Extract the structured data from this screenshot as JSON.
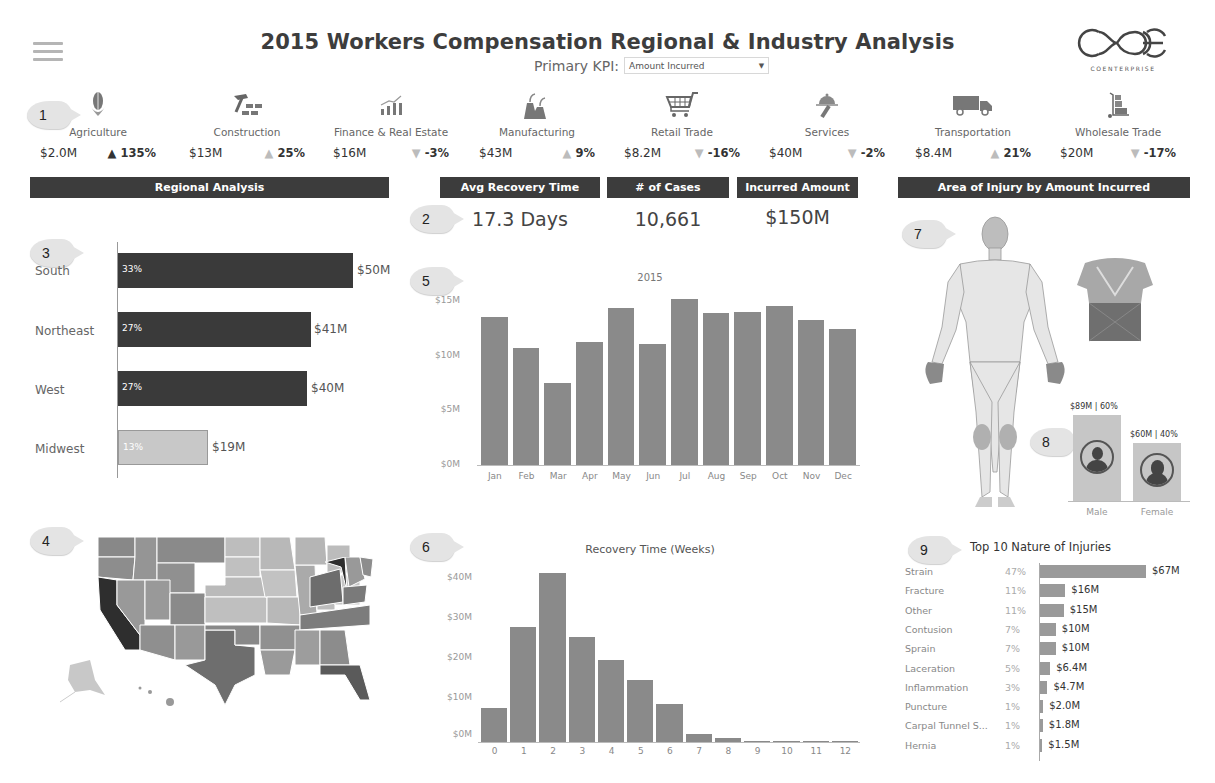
{
  "header": {
    "title": "2015 Workers Compensation Regional & Industry Analysis",
    "kpi_label": "Primary KPI:",
    "kpi_value": "Amount Incurred",
    "logo_text": "COENTERPRISE"
  },
  "markers": [
    "1",
    "2",
    "3",
    "4",
    "5",
    "6",
    "7",
    "8",
    "9"
  ],
  "industries": [
    {
      "name": "Agriculture",
      "value": "$2.0M",
      "delta": "135%",
      "direction": "up",
      "emphasis": "dark",
      "icon": "corn-icon"
    },
    {
      "name": "Construction",
      "value": "$13M",
      "delta": "25%",
      "direction": "up",
      "emphasis": "light",
      "icon": "hammer-bricks-icon"
    },
    {
      "name": "Finance & Real Estate",
      "value": "$16M",
      "delta": "-3%",
      "direction": "down",
      "emphasis": "light",
      "icon": "growth-chart-icon"
    },
    {
      "name": "Manufacturing",
      "value": "$43M",
      "delta": "9%",
      "direction": "up",
      "emphasis": "light",
      "icon": "factory-icon"
    },
    {
      "name": "Retail Trade",
      "value": "$8.2M",
      "delta": "-16%",
      "direction": "down",
      "emphasis": "light",
      "icon": "shopping-cart-icon"
    },
    {
      "name": "Services",
      "value": "$40M",
      "delta": "-2%",
      "direction": "down",
      "emphasis": "light",
      "icon": "service-cloche-icon"
    },
    {
      "name": "Transportation",
      "value": "$8.4M",
      "delta": "21%",
      "direction": "up",
      "emphasis": "light",
      "icon": "truck-icon"
    },
    {
      "name": "Wholesale Trade",
      "value": "$20M",
      "delta": "-17%",
      "direction": "down",
      "emphasis": "light",
      "icon": "hand-truck-icon"
    }
  ],
  "sections": {
    "regional": "Regional Analysis",
    "avg_recovery": "Avg Recovery Time",
    "cases": "# of Cases",
    "incurred": "Incurred Amount",
    "area_injury": "Area of Injury by Amount Incurred"
  },
  "summary": {
    "avg_recovery": "17.3 Days",
    "cases": "10,661",
    "incurred": "$150M"
  },
  "colors": {
    "header_bar": "#3c3c3c",
    "bar_dark": "#3a3a3a",
    "bar_light": "#c8c8c8",
    "bar_mid": "#8a8a8a"
  },
  "chart_data": [
    {
      "type": "bar",
      "orientation": "horizontal",
      "title": "Regional Analysis",
      "categories": [
        "South",
        "Northeast",
        "West",
        "Midwest"
      ],
      "values": [
        50,
        41,
        40,
        19
      ],
      "value_labels": [
        "$50M",
        "$41M",
        "$40M",
        "$19M"
      ],
      "percent_labels": [
        "33%",
        "27%",
        "27%",
        "13%"
      ],
      "unit": "$M"
    },
    {
      "type": "bar",
      "title": "2015",
      "categories": [
        "Jan",
        "Feb",
        "Mar",
        "Apr",
        "May",
        "Jun",
        "Jul",
        "Aug",
        "Sep",
        "Oct",
        "Nov",
        "Dec"
      ],
      "values": [
        13.5,
        10.6,
        7.5,
        11.2,
        14.3,
        11.0,
        15.1,
        13.8,
        13.9,
        14.5,
        13.2,
        12.4
      ],
      "yticks": [
        "$0M",
        "$5M",
        "$10M",
        "$15M"
      ],
      "ylim": [
        0,
        15.5
      ],
      "ylabel": "Amount Incurred ($M)",
      "grid": false
    },
    {
      "type": "bar",
      "title": "Recovery Time (Weeks)",
      "categories": [
        "0",
        "1",
        "2",
        "3",
        "4",
        "5",
        "6",
        "7",
        "8",
        "9",
        "10",
        "11",
        "12"
      ],
      "values": [
        8.2,
        28,
        41,
        25.5,
        20,
        15,
        9.3,
        2,
        1,
        0.3,
        0.1,
        0.1,
        0.05
      ],
      "yticks": [
        "$0M",
        "$10M",
        "$20M",
        "$30M",
        "$40M"
      ],
      "ylim": [
        0,
        42
      ],
      "xlabel": "Weeks",
      "grid": false
    },
    {
      "type": "bar",
      "orientation": "horizontal",
      "title": "Top 10 Nature of Injuries",
      "categories": [
        "Strain",
        "Fracture",
        "Other",
        "Contusion",
        "Sprain",
        "Laceration",
        "Inflammation",
        "Puncture",
        "Carpal Tunnel S...",
        "Hernia"
      ],
      "values": [
        67,
        16,
        15,
        10,
        10,
        6.4,
        4.7,
        2.0,
        1.8,
        1.5
      ],
      "value_labels": [
        "$67M",
        "$16M",
        "$15M",
        "$10M",
        "$10M",
        "$6.4M",
        "$4.7M",
        "$2.0M",
        "$1.8M",
        "$1.5M"
      ],
      "percent_labels": [
        "47%",
        "11%",
        "11%",
        "7%",
        "7%",
        "5%",
        "3%",
        "1%",
        "1%",
        "1%"
      ]
    },
    {
      "type": "bar",
      "title": "Gender",
      "categories": [
        "Male",
        "Female"
      ],
      "values": [
        89,
        60
      ],
      "value_labels": [
        "$89M | 60%",
        "$60M | 40%"
      ]
    }
  ],
  "monthly": {
    "title": "2015",
    "yticks": [
      "$15M",
      "$10M",
      "$5M",
      "$0M"
    ],
    "months": [
      "Jan",
      "Feb",
      "Mar",
      "Apr",
      "May",
      "Jun",
      "Jul",
      "Aug",
      "Sep",
      "Oct",
      "Nov",
      "Dec"
    ]
  },
  "recovery": {
    "title": "Recovery Time (Weeks)",
    "yticks": [
      "$40M",
      "$30M",
      "$20M",
      "$10M",
      "$0M"
    ],
    "weeks": [
      "0",
      "1",
      "2",
      "3",
      "4",
      "5",
      "6",
      "7",
      "8",
      "9",
      "10",
      "11",
      "12"
    ]
  },
  "injuries": {
    "title": "Top 10 Nature of Injuries",
    "rows": [
      {
        "name": "Strain",
        "pct": "47%",
        "value": "$67M",
        "amount": 67
      },
      {
        "name": "Fracture",
        "pct": "11%",
        "value": "$16M",
        "amount": 16
      },
      {
        "name": "Other",
        "pct": "11%",
        "value": "$15M",
        "amount": 15
      },
      {
        "name": "Contusion",
        "pct": "7%",
        "value": "$10M",
        "amount": 10
      },
      {
        "name": "Sprain",
        "pct": "7%",
        "value": "$10M",
        "amount": 10
      },
      {
        "name": "Laceration",
        "pct": "5%",
        "value": "$6.4M",
        "amount": 6.4
      },
      {
        "name": "Inflammation",
        "pct": "3%",
        "value": "$4.7M",
        "amount": 4.7
      },
      {
        "name": "Puncture",
        "pct": "1%",
        "value": "$2.0M",
        "amount": 2.0
      },
      {
        "name": "Carpal Tunnel S...",
        "pct": "1%",
        "value": "$1.8M",
        "amount": 1.8
      },
      {
        "name": "Hernia",
        "pct": "1%",
        "value": "$1.5M",
        "amount": 1.5
      }
    ]
  },
  "regions": [
    {
      "name": "South",
      "pct": "33%",
      "value": "$50M"
    },
    {
      "name": "Northeast",
      "pct": "27%",
      "value": "$41M"
    },
    {
      "name": "West",
      "pct": "27%",
      "value": "$40M"
    },
    {
      "name": "Midwest",
      "pct": "13%",
      "value": "$19M"
    }
  ],
  "gender": {
    "male": {
      "label": "Male",
      "top": "$89M | 60%"
    },
    "female": {
      "label": "Female",
      "top": "$60M | 40%"
    }
  }
}
